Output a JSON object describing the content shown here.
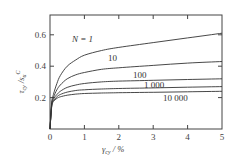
{
  "chart_data": {
    "type": "line",
    "title": "",
    "xlabel": "γ_cy / %",
    "ylabel": "τ_cy / s_u^C",
    "xlim": [
      0,
      5
    ],
    "ylim": [
      0,
      0.727
    ],
    "x_ticks": [
      "0",
      "1",
      "2",
      "3",
      "4",
      "5"
    ],
    "y_ticks": [
      "0.2",
      "0.4",
      "0.6"
    ],
    "grid": false,
    "legend_position": "inline labels",
    "x": [
      0,
      0.05,
      0.1,
      0.2,
      0.3,
      0.5,
      0.75,
      1,
      1.5,
      2,
      3,
      4,
      5
    ],
    "series": [
      {
        "name": "N = 1",
        "label": "N = 1",
        "values": [
          0,
          0.17,
          0.22,
          0.29,
          0.34,
          0.4,
          0.44,
          0.47,
          0.5,
          0.52,
          0.55,
          0.58,
          0.61
        ]
      },
      {
        "name": "10",
        "label": "10",
        "values": [
          0,
          0.16,
          0.2,
          0.25,
          0.28,
          0.32,
          0.345,
          0.36,
          0.38,
          0.39,
          0.405,
          0.42,
          0.43
        ]
      },
      {
        "name": "100",
        "label": "100",
        "values": [
          0,
          0.15,
          0.19,
          0.22,
          0.24,
          0.265,
          0.28,
          0.29,
          0.3,
          0.305,
          0.31,
          0.315,
          0.32
        ]
      },
      {
        "name": "1 000",
        "label": "1 000",
        "values": [
          0,
          0.15,
          0.18,
          0.205,
          0.22,
          0.235,
          0.245,
          0.25,
          0.255,
          0.258,
          0.262,
          0.266,
          0.27
        ]
      },
      {
        "name": "10 000",
        "label": "10 000",
        "values": [
          0,
          0.14,
          0.175,
          0.195,
          0.205,
          0.215,
          0.222,
          0.226,
          0.229,
          0.231,
          0.234,
          0.237,
          0.24
        ]
      }
    ]
  },
  "labels": {
    "y_axis": "τcy / su C",
    "x_axis": "γcy / %",
    "tick_0": "0",
    "tick_1": "1",
    "tick_2": "2",
    "tick_3": "3",
    "tick_4": "4",
    "tick_5": "5",
    "ytick_02": "0.2",
    "ytick_04": "0.4",
    "ytick_06": "0.6",
    "n1": "N = 1",
    "n10": "10",
    "n100": "100",
    "n1000": "1 000",
    "n10000": "10 000"
  },
  "colors": {
    "axis": "#444444",
    "curve": "#333333"
  }
}
